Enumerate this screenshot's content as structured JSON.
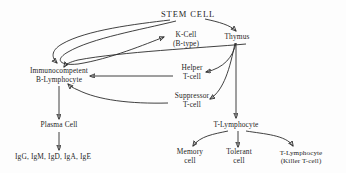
{
  "diagram": {
    "title": "STEM CELL",
    "type": "flowchart",
    "ink_color": "#2b2b2b",
    "background_color": "#fdfdfd",
    "nodes": [
      {
        "id": "stem_cell",
        "label_lines": [
          "STEM  CELL"
        ],
        "x": 188,
        "y": 14
      },
      {
        "id": "k_cell",
        "label_lines": [
          "K-Cell",
          "(B-type)"
        ],
        "x": 186,
        "y": 40
      },
      {
        "id": "thymus",
        "label_lines": [
          "Thymus"
        ],
        "x": 237,
        "y": 37
      },
      {
        "id": "b_lymphocyte",
        "label_lines": [
          "Immunocompetent",
          "B-Lymphocyte"
        ],
        "x": 59,
        "y": 76
      },
      {
        "id": "helper_t",
        "label_lines": [
          "Helper",
          "T-cell"
        ],
        "x": 192,
        "y": 73
      },
      {
        "id": "suppressor_t",
        "label_lines": [
          "Suppressor",
          "T-cell"
        ],
        "x": 192,
        "y": 101
      },
      {
        "id": "plasma_cell",
        "label_lines": [
          "Plasma Cell"
        ],
        "x": 59,
        "y": 125
      },
      {
        "id": "antibodies",
        "label_lines": [
          "IgG, IgM, IgD, IgA, IgE"
        ],
        "x": 53,
        "y": 157
      },
      {
        "id": "t_lymphocyte",
        "label_lines": [
          "T-Lymphocyte"
        ],
        "x": 236,
        "y": 125
      },
      {
        "id": "memory_cell",
        "label_lines": [
          "Memory",
          "cell"
        ],
        "x": 190,
        "y": 157
      },
      {
        "id": "tolerant_cell",
        "label_lines": [
          "Tolerant",
          "cell"
        ],
        "x": 239,
        "y": 157
      },
      {
        "id": "killer_t",
        "label_lines": [
          "T-Lymphocyte",
          "(Killer T-cell)"
        ],
        "x": 301,
        "y": 157
      }
    ],
    "edges": [
      {
        "from": "stem_cell",
        "to": "b_lymphocyte"
      },
      {
        "from": "stem_cell",
        "to": "k_cell"
      },
      {
        "from": "stem_cell",
        "to": "thymus"
      },
      {
        "from": "k_cell",
        "to": "b_lymphocyte"
      },
      {
        "from": "thymus",
        "to": "helper_t"
      },
      {
        "from": "thymus",
        "to": "suppressor_t"
      },
      {
        "from": "thymus",
        "to": "t_lymphocyte"
      },
      {
        "from": "helper_t",
        "to": "b_lymphocyte"
      },
      {
        "from": "suppressor_t",
        "to": "b_lymphocyte"
      },
      {
        "from": "b_lymphocyte",
        "to": "plasma_cell"
      },
      {
        "from": "plasma_cell",
        "to": "antibodies"
      },
      {
        "from": "t_lymphocyte",
        "to": "memory_cell"
      },
      {
        "from": "t_lymphocyte",
        "to": "tolerant_cell"
      },
      {
        "from": "t_lymphocyte",
        "to": "killer_t"
      }
    ]
  }
}
